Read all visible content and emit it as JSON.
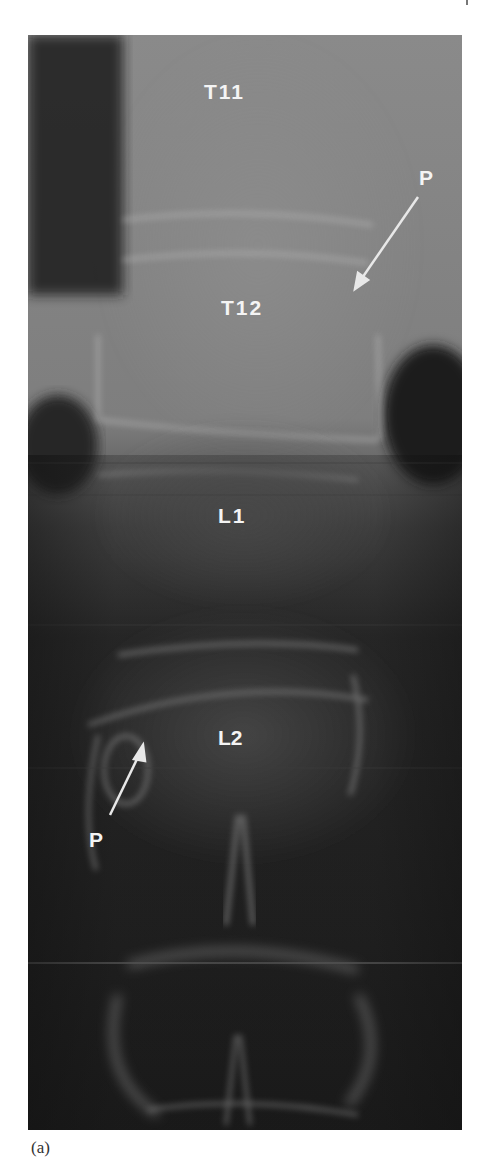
{
  "figure": {
    "type": "radiograph",
    "caption": "(a)",
    "labels": {
      "t11": "T11",
      "t12": "T12",
      "l1": "L1",
      "l2": "L2",
      "pedicle_upper": "P",
      "pedicle_lower": "P"
    },
    "arrows": [
      {
        "label": "P",
        "from": [
          418,
          197
        ],
        "to": [
          355,
          288
        ],
        "color": "#e8e8e8"
      },
      {
        "label": "P",
        "from": [
          110,
          815
        ],
        "to": [
          143,
          745
        ],
        "color": "#e8e8e8"
      }
    ],
    "colors": {
      "background": "#ffffff",
      "film_dark": "#151515",
      "bone_light": "#9a9a9a",
      "label_text": "#f4f4f4"
    }
  }
}
